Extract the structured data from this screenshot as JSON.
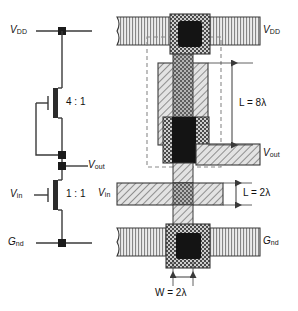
{
  "figure": {
    "panels": [
      {
        "name": "schematic",
        "side": "left"
      },
      {
        "name": "layout",
        "side": "right"
      }
    ]
  },
  "schematic": {
    "supply_label": "V",
    "supply_sub": "DD",
    "ground_label": "G",
    "ground_sub": "nd",
    "output_label": "V",
    "output_sub": "out",
    "input_label": "V",
    "input_sub": "in",
    "pullup_ratio": "4 : 1",
    "pulldown_ratio": "1 : 1"
  },
  "layout": {
    "vdd_label": "V",
    "vdd_sub": "DD",
    "gnd_label": "G",
    "gnd_sub": "nd",
    "vout_label": "V",
    "vout_sub": "out",
    "vin_label": "V",
    "vin_sub": "in",
    "dim_length_pullup": "L = 8λ",
    "dim_length_pulldown": "L = 2λ",
    "dim_width": "W = 2λ",
    "layers": [
      {
        "name": "metal",
        "pattern": "vertical-lines",
        "color": "#d8d8d8"
      },
      {
        "name": "diffusion",
        "pattern": "diagonal-hatch",
        "color": "#c9c9c9"
      },
      {
        "name": "polysilicon",
        "pattern": "checker-hatch",
        "color": "#9a9a9a"
      },
      {
        "name": "contact-cut",
        "pattern": "solid",
        "color": "#111111"
      },
      {
        "name": "implant",
        "pattern": "dashed-outline",
        "color": "#777777"
      }
    ]
  },
  "colors": {
    "line": "#3a3a3a",
    "text": "#111111",
    "metal_fill": "#dcdcdc",
    "diffusion_fill": "#cfcfcf",
    "poly_fill": "#8f8f8f",
    "cut_fill": "#141414"
  }
}
